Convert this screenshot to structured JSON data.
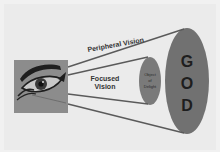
{
  "diagram": {
    "labels": {
      "peripheral": "Peripheral Vision",
      "focused_line1": "Focused",
      "focused_line2": "Vision",
      "object_line1": "Object",
      "object_line2": "of",
      "object_line3": "Delight",
      "god_g": "G",
      "god_o": "O",
      "god_d": "D"
    },
    "icons": {
      "eye": "eye-icon"
    },
    "colors": {
      "background": "#ebebeb",
      "eye_box": "#8c8c8c",
      "ellipse_fill": "#717171",
      "line": "#5a5a5a",
      "text": "#333333",
      "god_text": "#1e1e1e"
    }
  }
}
